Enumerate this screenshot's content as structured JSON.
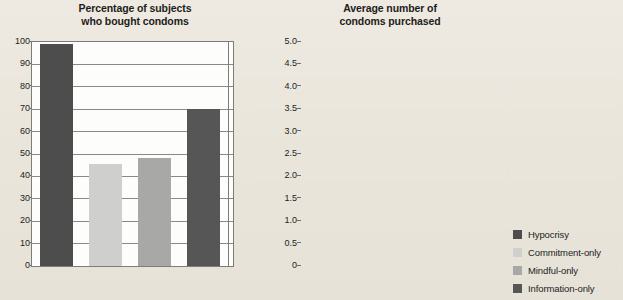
{
  "chart_data": [
    {
      "type": "bar",
      "title": "Percentage of subjects who bought condoms",
      "title_line1": "Percentage of subjects",
      "title_line2": "who bought condoms",
      "xlabel": "",
      "ylabel": "",
      "ylim": [
        0,
        100
      ],
      "ytick_step": 10,
      "yticks": [
        "100",
        "90",
        "80",
        "70",
        "60",
        "50",
        "40",
        "30",
        "20",
        "10",
        "0"
      ],
      "grid": true,
      "legend_position": "right-outside",
      "categories": [
        "Hypocrisy",
        "Commitment-only",
        "Mindful-only",
        "Information-only"
      ],
      "values": [
        83,
        33,
        50,
        43.5
      ]
    },
    {
      "type": "bar",
      "title": "Average number of condoms purchased",
      "title_line1": "Average number of",
      "title_line2": "condoms purchased",
      "xlabel": "",
      "ylabel": "",
      "ylim": [
        0,
        5
      ],
      "ytick_step": 0.5,
      "yticks": [
        "5.0",
        "4.5",
        "4.0",
        "3.5",
        "3.0",
        "2.5",
        "2.0",
        "1.5",
        "1.0",
        "0.5",
        "0"
      ],
      "grid": true,
      "legend_position": "right-outside",
      "categories": [
        "Hypocrisy",
        "Commitment-only",
        "Mindful-only",
        "Information-only"
      ],
      "values": [
        4.95,
        2.28,
        2.4,
        3.5
      ]
    }
  ],
  "legend": {
    "items": [
      {
        "label": "Hypocrisy",
        "color": "#4d4d4d"
      },
      {
        "label": "Commitment-only",
        "color": "#cfcfcd"
      },
      {
        "label": "Mindful-only",
        "color": "#a8a8a6"
      },
      {
        "label": "Information-only",
        "color": "#565656"
      }
    ]
  },
  "colors": {
    "background": "#eae6dc",
    "plot_background": "#fdfdfb",
    "axis": "#7d7d78",
    "gridline": "#8a8a85",
    "text": "#1d1d1b"
  }
}
